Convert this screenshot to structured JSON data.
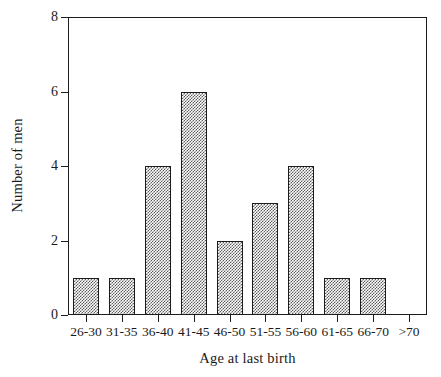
{
  "chart_data": {
    "type": "bar",
    "title": "",
    "xlabel": "Age at last birth",
    "ylabel": "Number of men",
    "categories": [
      "26-30",
      "31-35",
      "36-40",
      "41-45",
      "46-50",
      "51-55",
      "56-60",
      "61-65",
      "66-70",
      ">70"
    ],
    "values": [
      1,
      1,
      4,
      6,
      2,
      3,
      4,
      1,
      1,
      0
    ],
    "ylim": [
      0,
      8
    ],
    "yticks": [
      0,
      2,
      4,
      6,
      8
    ],
    "ytick_labels": [
      "0",
      "2",
      "4",
      "6",
      "8"
    ],
    "grid": false,
    "legend": null,
    "bar_fill": "#b0b0b0",
    "bar_pattern": "checkerboard-stipple",
    "bar_edge_color": "#1c1c1c",
    "axis_color": "#1c1c1c",
    "background": "#ffffff"
  }
}
